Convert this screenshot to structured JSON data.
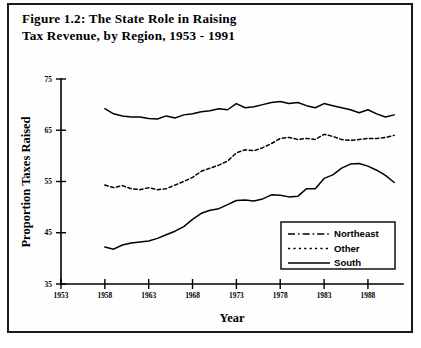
{
  "figure": {
    "title_line1": "Figure 1.2:  The State Role in Raising",
    "title_line2": "Tax Revenue, by Region, 1953 - 1991",
    "border_color": "#1a1a1a"
  },
  "chart_data": {
    "type": "line",
    "title": "Figure 1.2:  The State Role in Raising Tax Revenue, by Region, 1953 - 1991",
    "xlabel": "Year",
    "ylabel": "Proportion Taxes Raised",
    "xlim": [
      1953,
      1992
    ],
    "ylim": [
      35,
      75
    ],
    "yticks": [
      35,
      45,
      55,
      65,
      75
    ],
    "xticks": [
      1953,
      1958,
      1963,
      1968,
      1973,
      1978,
      1983,
      1988
    ],
    "grid": false,
    "legend_position": "lower right",
    "x": [
      1958,
      1959,
      1960,
      1961,
      1962,
      1963,
      1964,
      1965,
      1966,
      1967,
      1968,
      1969,
      1970,
      1971,
      1972,
      1973,
      1974,
      1975,
      1976,
      1977,
      1978,
      1979,
      1980,
      1981,
      1982,
      1983,
      1984,
      1985,
      1986,
      1987,
      1988,
      1989,
      1990,
      1991
    ],
    "series": [
      {
        "name": "Northeast",
        "style": "dash-dot",
        "values": [
          42.2,
          41.8,
          42.6,
          43.0,
          43.2,
          43.4,
          43.9,
          44.6,
          45.3,
          46.2,
          47.6,
          48.8,
          49.4,
          49.7,
          50.5,
          51.3,
          51.4,
          51.2,
          51.6,
          52.4,
          52.3,
          52.0,
          52.1,
          53.6,
          53.6,
          55.6,
          56.3,
          57.6,
          58.4,
          58.5,
          58.0,
          57.2,
          56.2,
          54.8
        ]
      },
      {
        "name": "Other",
        "style": "dotted",
        "values": [
          54.3,
          53.8,
          54.2,
          53.6,
          53.4,
          53.8,
          53.4,
          53.6,
          54.3,
          55.0,
          55.8,
          57.0,
          57.6,
          58.2,
          59.0,
          60.6,
          61.2,
          61.0,
          61.6,
          62.4,
          63.4,
          63.6,
          63.2,
          63.4,
          63.2,
          64.2,
          63.8,
          63.2,
          63.0,
          63.2,
          63.4,
          63.4,
          63.6,
          64.0
        ]
      },
      {
        "name": "South",
        "style": "solid",
        "values": [
          69.2,
          68.2,
          67.8,
          67.6,
          67.6,
          67.3,
          67.2,
          67.8,
          67.4,
          68.0,
          68.2,
          68.6,
          68.8,
          69.2,
          69.0,
          70.2,
          69.4,
          69.6,
          70.0,
          70.4,
          70.6,
          70.2,
          70.4,
          69.8,
          69.4,
          70.2,
          69.8,
          69.4,
          69.0,
          68.4,
          69.0,
          68.2,
          67.6,
          68.0
        ]
      }
    ]
  },
  "legend": {
    "items": [
      {
        "label": "Northeast",
        "style": "dash-dot"
      },
      {
        "label": "Other",
        "style": "dotted"
      },
      {
        "label": "South",
        "style": "solid"
      }
    ]
  }
}
